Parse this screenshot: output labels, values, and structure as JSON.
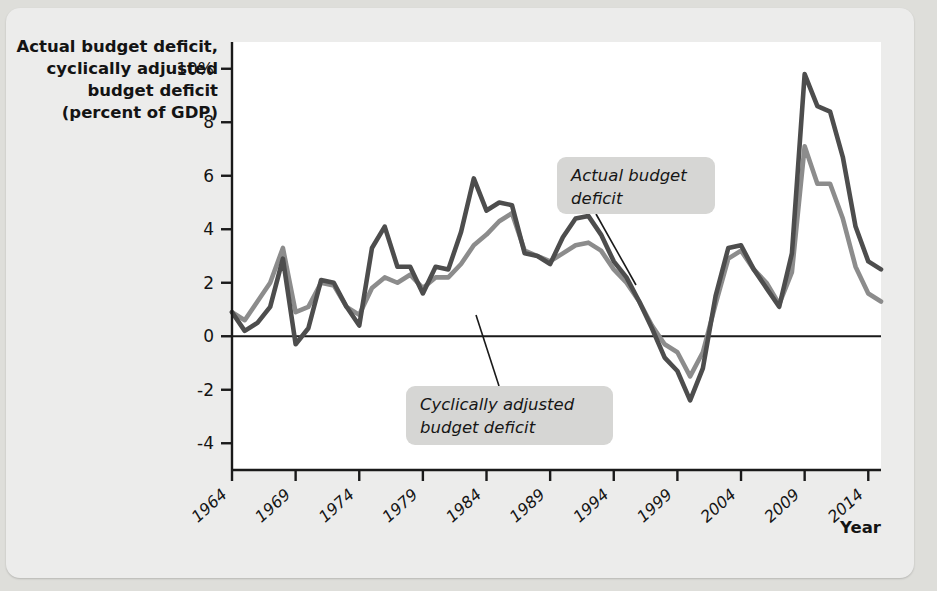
{
  "chart_data": {
    "type": "line",
    "title": "",
    "ylabel": "Actual budget deficit, cyclically adjusted budget deficit (percent of GDP)",
    "ylabel_lines": [
      "Actual budget deficit,",
      "cyclically adjusted",
      "budget deficit",
      "(percent of GDP)"
    ],
    "xlabel": "Year",
    "ylim": [
      -5,
      11
    ],
    "xlim": [
      1964,
      2015
    ],
    "ytick_labels": [
      "10%",
      "8",
      "6",
      "4",
      "2",
      "0",
      "-2",
      "-4"
    ],
    "ytick_values": [
      10,
      8,
      6,
      4,
      2,
      0,
      -2,
      -4
    ],
    "xtick_labels": [
      "1964",
      "1969",
      "1974",
      "1979",
      "1984",
      "1989",
      "1994",
      "1999",
      "2004",
      "2009",
      "2014"
    ],
    "xtick_values": [
      1964,
      1969,
      1974,
      1979,
      1984,
      1989,
      1994,
      1999,
      2004,
      2009,
      2014
    ],
    "grid": false,
    "legend_position": "annotations",
    "zero_line": 0,
    "x": [
      1964,
      1965,
      1966,
      1967,
      1968,
      1969,
      1970,
      1971,
      1972,
      1973,
      1974,
      1975,
      1976,
      1977,
      1978,
      1979,
      1980,
      1981,
      1982,
      1983,
      1984,
      1985,
      1986,
      1987,
      1988,
      1989,
      1990,
      1991,
      1992,
      1993,
      1994,
      1995,
      1996,
      1997,
      1998,
      1999,
      2000,
      2001,
      2002,
      2003,
      2004,
      2005,
      2006,
      2007,
      2008,
      2009,
      2010,
      2011,
      2012,
      2013,
      2014,
      2015
    ],
    "series": [
      {
        "name": "Actual budget deficit",
        "color": "#4d4d4d",
        "values": [
          0.9,
          0.2,
          0.5,
          1.1,
          2.9,
          -0.3,
          0.3,
          2.1,
          2.0,
          1.1,
          0.4,
          3.3,
          4.1,
          2.6,
          2.6,
          1.6,
          2.6,
          2.5,
          3.9,
          5.9,
          4.7,
          5.0,
          4.9,
          3.1,
          3.0,
          2.7,
          3.7,
          4.4,
          4.5,
          3.8,
          2.8,
          2.2,
          1.3,
          0.3,
          -0.8,
          -1.3,
          -2.4,
          -1.2,
          1.5,
          3.3,
          3.4,
          2.5,
          1.8,
          1.1,
          3.1,
          9.8,
          8.6,
          8.4,
          6.7,
          4.1,
          2.8,
          2.5
        ],
        "linewidth": 4.6
      },
      {
        "name": "Cyclically adjusted budget deficit",
        "color": "#8c8c8c",
        "values": [
          0.9,
          0.6,
          1.3,
          2.0,
          3.3,
          0.9,
          1.1,
          2.0,
          1.9,
          1.1,
          0.8,
          1.8,
          2.2,
          2.0,
          2.3,
          1.8,
          2.2,
          2.2,
          2.7,
          3.4,
          3.8,
          4.3,
          4.6,
          3.2,
          3.0,
          2.8,
          3.1,
          3.4,
          3.5,
          3.2,
          2.5,
          2.0,
          1.3,
          0.4,
          -0.3,
          -0.6,
          -1.5,
          -0.6,
          1.2,
          2.9,
          3.2,
          2.5,
          2.0,
          1.2,
          2.4,
          7.1,
          5.7,
          5.7,
          4.4,
          2.6,
          1.6,
          1.3
        ],
        "linewidth": 4.6
      }
    ],
    "annotations": [
      {
        "id": "actual-budget-deficit-callout",
        "text": "Actual budget deficit",
        "lines": [
          "Actual budget",
          "deficit"
        ],
        "box": {
          "x": 551,
          "y": 149,
          "w": 158,
          "h": 57
        },
        "leader": {
          "x1": 590,
          "y1": 206,
          "x2": 630,
          "y2": 277
        }
      },
      {
        "id": "cyclically-adjusted-budget-deficit-callout",
        "text": "Cyclically adjusted budget deficit",
        "lines": [
          "Cyclically adjusted",
          "budget deficit"
        ],
        "box": {
          "x": 400,
          "y": 378,
          "w": 207,
          "h": 59
        },
        "leader": {
          "x1": 493,
          "y1": 378,
          "x2": 470,
          "y2": 307
        }
      }
    ]
  },
  "figure": {
    "background_color": "#ececeb",
    "plot_background_color": "#ffffff",
    "axis_color": "#1a1a1a",
    "callout_background_color": "#d6d6d4"
  }
}
